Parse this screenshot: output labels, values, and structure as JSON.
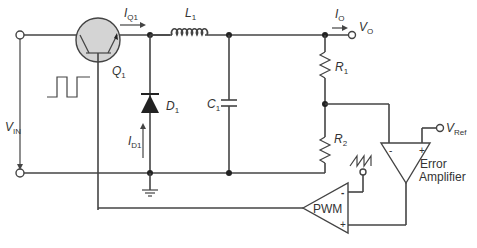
{
  "diagram": {
    "type": "buck converter schematic",
    "components": {
      "q1": {
        "label": "Q",
        "sub": "1"
      },
      "l1": {
        "label": "L",
        "sub": "1"
      },
      "d1": {
        "label": "D",
        "sub": "1"
      },
      "c1": {
        "label": "C",
        "sub": "1"
      },
      "r1": {
        "label": "R",
        "sub": "1"
      },
      "r2": {
        "label": "R",
        "sub": "2"
      },
      "pwm": {
        "label": "PWM",
        "minus": "-",
        "plus": "+"
      },
      "error_amp": {
        "line1": "Error",
        "line2": "Amplifier",
        "minus": "-",
        "plus": "+"
      }
    },
    "signals": {
      "vin": {
        "label": "V",
        "sub": "IN"
      },
      "vo": {
        "label": "V",
        "sub": "O"
      },
      "io": {
        "label": "I",
        "sub": "O"
      },
      "iq1": {
        "label": "I",
        "sub": "Q1"
      },
      "id1": {
        "label": "I",
        "sub": "D1"
      },
      "vref": {
        "label": "V",
        "sub": "Ref"
      }
    },
    "colors": {
      "wire": "#444444",
      "transistor_fill": "#d4d4d4",
      "background": "#ffffff"
    }
  }
}
